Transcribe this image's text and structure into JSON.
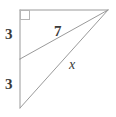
{
  "figure": {
    "kind": "right-triangle-with-cevian",
    "background_color": "#ffffff",
    "stroke_color": "#9a9a9a",
    "stroke_width": 1,
    "text_color": "#3a3a3a",
    "width": 116,
    "height": 117,
    "vertices": {
      "top_left": {
        "x": 20,
        "y": 10
      },
      "apex_right": {
        "x": 108,
        "y": 10
      },
      "bottom_left": {
        "x": 20,
        "y": 108
      },
      "leg_midpoint": {
        "x": 20,
        "y": 59
      }
    },
    "right_angle_marker": {
      "corner": "top_left",
      "x": 20,
      "y": 10,
      "size": 9
    },
    "segments": [
      {
        "name": "top-edge",
        "from": "top_left",
        "to": "apex_right"
      },
      {
        "name": "vertical-leg-upper",
        "from": "top_left",
        "to": "leg_midpoint"
      },
      {
        "name": "vertical-leg-lower",
        "from": "leg_midpoint",
        "to": "bottom_left"
      },
      {
        "name": "cevian",
        "from": "leg_midpoint",
        "to": "apex_right"
      },
      {
        "name": "hypotenuse",
        "from": "bottom_left",
        "to": "apex_right"
      }
    ],
    "labels": {
      "leg_upper": "3",
      "leg_lower": "3",
      "cevian": "7",
      "hypotenuse": "x"
    }
  }
}
